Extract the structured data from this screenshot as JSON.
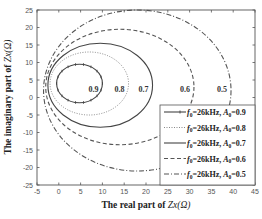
{
  "chart_data": {
    "type": "line",
    "title": "",
    "xlabel": "The real part of Zx(Ω)",
    "ylabel": "The imaginary part of Zx(Ω)",
    "xlim": [
      -5,
      45
    ],
    "ylim": [
      -25,
      25
    ],
    "xticks": [
      -5,
      0,
      5,
      10,
      15,
      20,
      25,
      30,
      35,
      40,
      45
    ],
    "yticks": [
      25,
      20,
      15,
      10,
      5,
      0,
      -5,
      -10,
      -15,
      -20,
      -25
    ],
    "grid": false,
    "legend_position": "lower right",
    "series": [
      {
        "name": "f0=26kHz, A0=0.9",
        "label": "0.9",
        "style": "solid-marker",
        "color": "#444444",
        "shape": "closed loop",
        "center": [
          4.75,
          4
        ],
        "radius": [
          5.25,
          5.5
        ]
      },
      {
        "name": "f0=26kHz, A0=0.8",
        "label": "0.8",
        "style": "dotted",
        "color": "#888888",
        "shape": "closed loop",
        "center": [
          7,
          4
        ],
        "radius": [
          9,
          9
        ]
      },
      {
        "name": "f0=26kHz, A0=0.7",
        "label": "0.7",
        "style": "solid",
        "color": "#444444",
        "shape": "closed loop",
        "center": [
          9.5,
          3.5
        ],
        "radius": [
          12,
          12
        ]
      },
      {
        "name": "f0=26kHz, A0=0.6",
        "label": "0.6",
        "style": "dashed",
        "color": "#555555",
        "shape": "closed loop",
        "center": [
          14,
          3
        ],
        "radius": [
          17,
          16.5
        ]
      },
      {
        "name": "f0=26kHz, A0=0.5",
        "label": "0.5",
        "style": "dash-dot",
        "color": "#555555",
        "shape": "closed loop",
        "center": [
          18,
          2
        ],
        "radius": [
          21.5,
          23
        ]
      }
    ]
  },
  "axes": {
    "xlabel_prefix": "The real part of ",
    "xlabel_var": "Zx(Ω)",
    "ylabel_prefix": "The imaginary part of ",
    "ylabel_var": "Zx(Ω)"
  },
  "legend": {
    "items": [
      {
        "f": "f",
        "fsub": "0",
        "mid": "=26kHz, ",
        "a": "A",
        "asub": "0",
        "val": "=0.9"
      },
      {
        "f": "f",
        "fsub": "0",
        "mid": "=26kHz, ",
        "a": "A",
        "asub": "0",
        "val": "=0.8"
      },
      {
        "f": "f",
        "fsub": "0",
        "mid": "=26kHz, ",
        "a": "A",
        "asub": "0",
        "val": "=0.7"
      },
      {
        "f": "f",
        "fsub": "0",
        "mid": "=26kHz, ",
        "a": "A",
        "asub": "0",
        "val": "=0.6"
      },
      {
        "f": "f",
        "fsub": "0",
        "mid": "=26kHz, ",
        "a": "A",
        "asub": "0",
        "val": "=0.5"
      }
    ]
  }
}
